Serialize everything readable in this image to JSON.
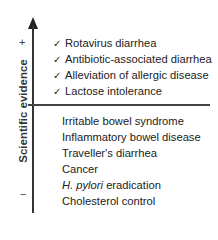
{
  "axis": {
    "label": "Scientific evidence",
    "plus": "+",
    "minus": "−"
  },
  "strong_evidence": [
    {
      "check": "✓",
      "label": "Rotavirus diarrhea"
    },
    {
      "check": "✓",
      "label": "Antibiotic-associated diarrhea"
    },
    {
      "check": "✓",
      "label": "Alleviation of allergic disease"
    },
    {
      "check": "✓",
      "label": "Lactose intolerance"
    }
  ],
  "weak_evidence": [
    {
      "label": "Irritable bowel syndrome"
    },
    {
      "label": "Inflammatory bowel disease"
    },
    {
      "label": "Traveller's diarrhea"
    },
    {
      "label": "Cancer"
    },
    {
      "italic": "H. pylori",
      "label": " eradication"
    },
    {
      "label": "Cholesterol control"
    }
  ]
}
